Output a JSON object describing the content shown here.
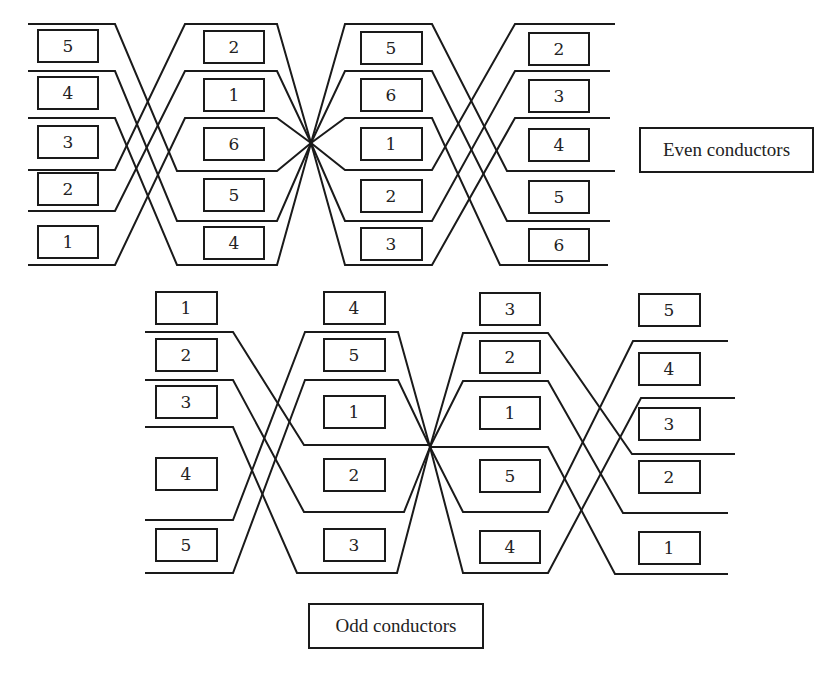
{
  "even": {
    "legend": "Even conductors",
    "columns": [
      {
        "x": 38,
        "labels": [
          "5",
          "4",
          "3",
          "2",
          "1"
        ],
        "ys": [
          30,
          76,
          124,
          170,
          223
        ]
      },
      {
        "x": 204,
        "labels": [
          "2",
          "1",
          "6",
          "5",
          "4"
        ],
        "ys": [
          31,
          78,
          127,
          178,
          229
        ]
      },
      {
        "x": 361,
        "labels": [
          "5",
          "6",
          "1",
          "2",
          "3"
        ],
        "ys": [
          31,
          78,
          127,
          178,
          229
        ]
      },
      {
        "x": 528,
        "labels": [
          "2",
          "3",
          "4",
          "5",
          "6"
        ],
        "ys": [
          32,
          79,
          128,
          180,
          229
        ]
      }
    ]
  },
  "odd": {
    "legend": "Odd conductors",
    "columns": [
      {
        "x": 156,
        "labels": [
          "1",
          "2",
          "3",
          "4",
          "5"
        ],
        "ys": [
          292,
          339,
          386,
          458,
          529
        ]
      },
      {
        "x": 323,
        "labels": [
          "4",
          "5",
          "1",
          "2",
          "3"
        ],
        "ys": [
          292,
          339,
          396,
          459,
          529
        ]
      },
      {
        "x": 479,
        "labels": [
          "3",
          "2",
          "1",
          "5",
          "4"
        ],
        "ys": [
          292,
          339,
          396,
          459,
          529
        ]
      },
      {
        "x": 638,
        "labels": [
          "5",
          "4",
          "3",
          "2",
          "1"
        ],
        "ys": [
          293,
          352,
          408,
          461,
          531
        ]
      }
    ]
  },
  "colors": {
    "stroke": "#1a1a1a",
    "background": "#ffffff"
  }
}
